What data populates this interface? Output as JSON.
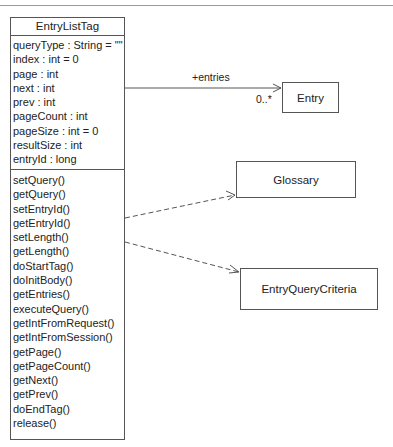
{
  "diagram": {
    "type": "UML class diagram",
    "main_class": {
      "name": "EntryListTag",
      "attributes": [
        "queryType : String = \"\"",
        "index : int = 0",
        "page : int",
        "next : int",
        "prev : int",
        "pageCount : int",
        "pageSize : int = 0",
        "resultSize : int",
        "entryId : long"
      ],
      "methods": [
        "setQuery()",
        "getQuery()",
        "setEntryId()",
        "getEntryId()",
        "setLength()",
        "getLength()",
        "doStartTag()",
        "doInitBody()",
        "getEntries()",
        "executeQuery()",
        "getIntFromRequest()",
        "getIntFromSession()",
        "getPage()",
        "getPageCount()",
        "getNext()",
        "getPrev()",
        "doEndTag()",
        "release()"
      ]
    },
    "classes": {
      "entry": "Entry",
      "glossary": "Glossary",
      "criteria": "EntryQueryCriteria"
    },
    "associations": {
      "entries_role": "+entries",
      "entries_multiplicity": "0..*"
    },
    "colors": {
      "line": "#555555",
      "background": "#ffffff",
      "text": "#222222"
    }
  }
}
